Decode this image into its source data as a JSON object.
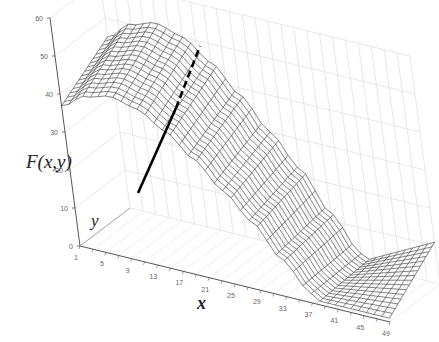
{
  "chart_data": {
    "type": "surface",
    "title": "",
    "zlabel": "F(x,y)",
    "xlabel": "x",
    "ylabel": "y",
    "z_ticks": [
      0,
      10,
      20,
      30,
      40,
      50,
      60
    ],
    "zlim": [
      0,
      60
    ],
    "x_ticks": [
      1,
      5,
      9,
      13,
      17,
      21,
      25,
      29,
      33,
      37,
      41,
      45,
      49
    ],
    "xlim": [
      1,
      49
    ],
    "grid": true,
    "style": "wireframe",
    "annotations": [
      {
        "type": "line",
        "style": "solid-then-dashed",
        "color": "#000000",
        "description": "thick black line crossing surface, solid lower part, dashed upper part"
      }
    ],
    "surface_profile": {
      "description": "Surface peaks near x=1..10 at about 52-53, declines smoothly toward x≈37 reaching ~0, then rises slightly toward x=49 at far y (~8-10)",
      "x": [
        1,
        5,
        9,
        13,
        17,
        21,
        25,
        29,
        33,
        37,
        41,
        45,
        49
      ],
      "z_approx": [
        45,
        50,
        52,
        50,
        45,
        38,
        30,
        22,
        12,
        3,
        2,
        4,
        8
      ]
    }
  },
  "labels": {
    "zaxis": "F(x,y)",
    "xaxis": "x",
    "yaxis": "y"
  },
  "colors": {
    "mesh": "#333333",
    "grid": "#d9d9d9",
    "axis": "#555555",
    "annotation_line": "#000000"
  }
}
